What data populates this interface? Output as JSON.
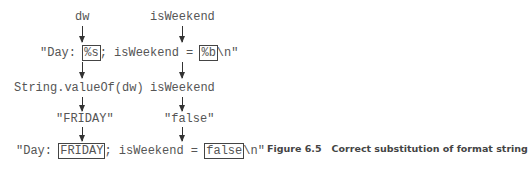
{
  "diagram": {
    "row1": {
      "left": "dw",
      "right": "isWeekend"
    },
    "row2": {
      "prefix": "\"Day: ",
      "box1": "%s",
      "middle": "; isWeekend = ",
      "box2": "%b",
      "suffix": "\\n\""
    },
    "row3": {
      "left": "String.valueOf(dw)",
      "right": "isWeekend"
    },
    "row4": {
      "left": "\"FRIDAY\"",
      "right": "\"false\""
    },
    "row5": {
      "prefix": "\"Day: ",
      "box1": "FRIDAY",
      "middle": "; isWeekend = ",
      "box2": "false",
      "suffix": "\\n\""
    }
  },
  "caption": {
    "number": "Figure 6.5",
    "text": "Correct substitution of format string"
  }
}
